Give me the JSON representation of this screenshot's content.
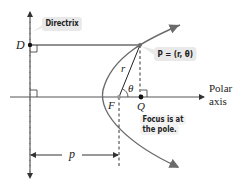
{
  "diagram": {
    "labels": {
      "directrix": "Directrix",
      "point_d": "D",
      "point_p": "P = (r, θ)",
      "radius": "r",
      "angle": "θ",
      "focus": "F",
      "point_q": "Q",
      "polar_axis_line1": "Polar",
      "polar_axis_line2": "axis",
      "focus_note_line1": "Focus is at",
      "focus_note_line2": "the pole.",
      "distance": "p"
    },
    "colors": {
      "line": "#222222",
      "curve": "#6b6b6b",
      "callout_bg": "#e9e9e9"
    }
  }
}
